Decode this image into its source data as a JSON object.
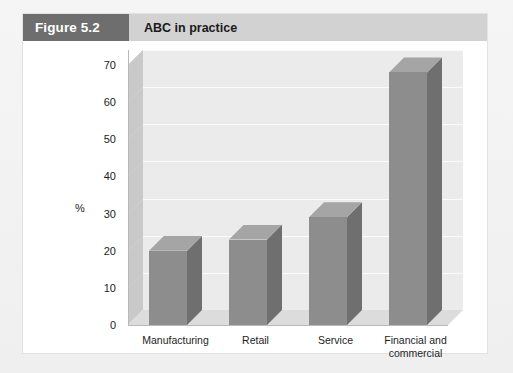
{
  "figure": {
    "number_label": "Figure 5.2",
    "title": "ABC in practice"
  },
  "chart_data": {
    "type": "bar",
    "title": "ABC in practice",
    "xlabel": "",
    "ylabel": "%",
    "categories": [
      "Manufacturing",
      "Retail",
      "Service",
      "Financial and commercial"
    ],
    "values": [
      20,
      23,
      29,
      68
    ],
    "ylim": [
      0,
      70
    ],
    "yticks": [
      0,
      10,
      20,
      30,
      40,
      50,
      60,
      70
    ],
    "ytick_labels": [
      "0",
      "10",
      "20",
      "30",
      "40",
      "50",
      "60",
      "70"
    ],
    "grid": true,
    "legend": "none",
    "style": "3d-column",
    "colors": {
      "bar_front": "#8d8d8d",
      "bar_side": "#6f6f6f",
      "bar_top": "#a5a5a5",
      "plot_background": "#ebebeb",
      "left_wall": "#c9c9c9",
      "floor": "#dcdcdc",
      "gridline": "#fbfbfb",
      "axis": "#b9b9b9"
    }
  },
  "axis": {
    "y_unit_label": "%"
  },
  "xtick_lines": [
    [
      "Manufacturing"
    ],
    [
      "Retail"
    ],
    [
      "Service"
    ],
    [
      "Financial and",
      "commercial"
    ]
  ]
}
